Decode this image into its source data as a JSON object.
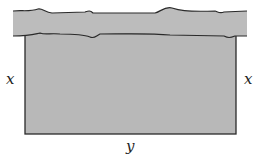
{
  "diagram": {
    "labels": {
      "left_side": "x",
      "right_side": "x",
      "bottom_side": "y"
    },
    "colors": {
      "river_fill": "#bcbcbc",
      "field_fill": "#b8b8b8",
      "outline": "#2a2a2a"
    }
  }
}
